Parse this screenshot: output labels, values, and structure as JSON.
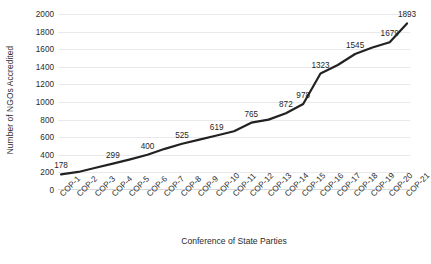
{
  "chart_data": {
    "type": "line",
    "title": "",
    "xlabel": "Conference of State Parties",
    "ylabel": "Number of NGOs Accredited",
    "categories": [
      "COP-1",
      "COP-2",
      "COP-3",
      "COP-4",
      "COP-5",
      "COP-6",
      "COP-7",
      "COP-8",
      "COP-9",
      "COP-10",
      "COP-11",
      "COP-12",
      "COP-13",
      "COP-14",
      "COP-15",
      "COP-16",
      "COP-17",
      "COP-18",
      "COP-19",
      "COP-20",
      "COP-21"
    ],
    "values": [
      178,
      205,
      253,
      299,
      348,
      400,
      468,
      525,
      572,
      619,
      668,
      765,
      800,
      872,
      978,
      1323,
      1420,
      1545,
      1620,
      1679,
      1893
    ],
    "point_labels": [
      "178",
      "",
      "",
      "299",
      "",
      "400",
      "",
      "525",
      "",
      "619",
      "",
      "765",
      "",
      "872",
      "978",
      "1323",
      "",
      "1545",
      "",
      "1679",
      "1893"
    ],
    "ylim": [
      0,
      2000
    ],
    "ytick_values": [
      0,
      200,
      400,
      600,
      800,
      1000,
      1200,
      1400,
      1600,
      1800,
      2000
    ],
    "ytick_labels": [
      "0",
      "200",
      "400",
      "600",
      "800",
      "1000",
      "1200",
      "1400",
      "1600",
      "1800",
      "2000"
    ],
    "grid": true,
    "gridlines": "horizontal",
    "legend": "none",
    "line_color": "#222222",
    "line_width": 2.2,
    "markers": "none",
    "background_color": "#ffffff",
    "gridline_color": "#e9e9ec",
    "text_color": "#2b2b2b",
    "xtick_rotation": -45
  }
}
